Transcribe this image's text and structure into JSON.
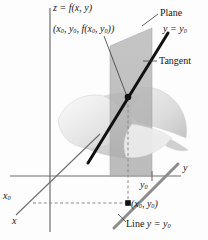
{
  "figure": {
    "title_equation": "z = f(x, y)",
    "labels": {
      "surface_equation": "z = f(x, y)",
      "point_3d": "(x0, y0, f(x0, y0))",
      "plane": "Plane",
      "plane_equation": "y = y0",
      "tangent": "Tangent",
      "axis_y": "y",
      "axis_x": "x",
      "tick_y0": "y0",
      "tick_x0": "x0",
      "point_2d": "(x0, y0)",
      "line_label": "Line y = y0"
    },
    "colors": {
      "axis": "#6e6e6e",
      "surface_light": "#e9e9e9",
      "surface_mid": "#d2d2d2",
      "surface_dark": "#bcbcbc",
      "plane_fill": "#b9b9b9",
      "tangent_line": "#111111",
      "trace_line": "#8c8c8c",
      "dashed": "#8a8a8a",
      "point": "#111111",
      "background": "#fdfdfd"
    },
    "geometry": {
      "origin": [
        50,
        176
      ],
      "tangency_point": [
        128,
        97
      ],
      "foot_point": [
        128,
        203
      ],
      "y0_tick": [
        152,
        176
      ],
      "x0_tick": [
        33,
        203
      ],
      "z_axis_top": [
        50,
        8
      ],
      "z_axis_bottom": [
        50,
        232
      ],
      "y_axis_right": [
        180,
        176
      ],
      "x_axis_end": [
        18,
        216
      ]
    }
  }
}
